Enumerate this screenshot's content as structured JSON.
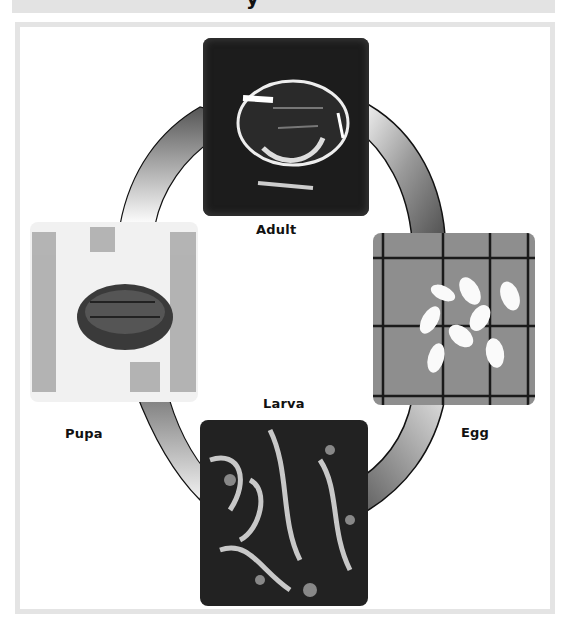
{
  "banner": {
    "title_fragment": "y"
  },
  "diagram": {
    "type": "life-cycle",
    "stages": [
      {
        "id": "adult",
        "label": "Adult"
      },
      {
        "id": "egg",
        "label": "Egg"
      },
      {
        "id": "larva",
        "label": "Larva"
      },
      {
        "id": "pupa",
        "label": "Pupa"
      }
    ],
    "cycle_order": [
      "Adult",
      "Egg",
      "Larva",
      "Pupa",
      "Adult"
    ],
    "colors": {
      "frame_border": "#e4e4e4",
      "banner_bg": "#e3e3e3",
      "arrow_dark": "#3a3a3a",
      "arrow_light": "#d8d8d8",
      "photo_dark": "#1a1a1a"
    }
  }
}
